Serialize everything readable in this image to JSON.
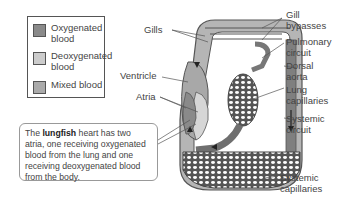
{
  "legend": {
    "items": [
      {
        "label_line1": "Oxygenated",
        "label_line2": "blood",
        "color": "#8a8a8a"
      },
      {
        "label_line1": "Deoxygenated",
        "label_line2": "blood",
        "color": "#cccccc"
      },
      {
        "label_line1": "Mixed blood",
        "label_line2": "",
        "color": "#aaaaaa"
      }
    ]
  },
  "labels": {
    "gills": "Gills",
    "gill_bypasses_1": "Gill",
    "gill_bypasses_2": "bypasses",
    "pulmonary_1": "Pulmonary",
    "pulmonary_2": "circuit",
    "dorsal_1": "Dorsal",
    "dorsal_2": "aorta",
    "lung_1": "Lung",
    "lung_2": "capillaries",
    "systemic_circuit_1": "Systemic",
    "systemic_circuit_2": "circuit",
    "systemic_cap_1": "Systemic",
    "systemic_cap_2": "capillaries",
    "ventricle": "Ventricle",
    "atria": "Atria"
  },
  "callout": {
    "prefix": "The ",
    "bold": "lungfish",
    "suffix": " heart has two atria, one receiving oxygenated blood from the lung and one receiving deoxygenated blood from the body."
  }
}
